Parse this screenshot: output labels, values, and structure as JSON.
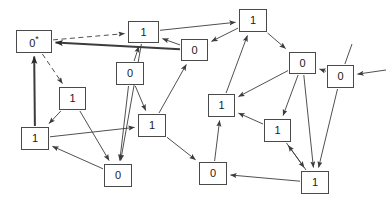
{
  "diagram": {
    "background_color": "#ffffff",
    "node_border_color": "#4a4a4a",
    "edge_color": "#3c3c3c",
    "nodes": [
      {
        "id": "n0",
        "label": "0",
        "marked": true,
        "marker": "*",
        "x": 16,
        "y": 30,
        "w": 36,
        "h": 23
      },
      {
        "id": "n1",
        "label": "1",
        "marked": false,
        "marker": "",
        "x": 128,
        "y": 21,
        "w": 31,
        "h": 22
      },
      {
        "id": "n2",
        "label": "1",
        "marked": false,
        "marker": "",
        "x": 239,
        "y": 9,
        "w": 28,
        "h": 23
      },
      {
        "id": "n3",
        "label": "0",
        "marked": false,
        "marker": "",
        "x": 181,
        "y": 39,
        "w": 27,
        "h": 22
      },
      {
        "id": "n4",
        "label": "0",
        "marked": false,
        "marker": "",
        "x": 289,
        "y": 52,
        "w": 27,
        "h": 22
      },
      {
        "id": "n5",
        "label": "0",
        "marked": false,
        "marker": "",
        "x": 327,
        "y": 65,
        "w": 27,
        "h": 23
      },
      {
        "id": "n6",
        "label": "0",
        "marked": false,
        "marker": "",
        "x": 116,
        "y": 62,
        "w": 28,
        "h": 23
      },
      {
        "id": "n7",
        "label": "1",
        "marked": false,
        "marker": "",
        "x": 59,
        "y": 87,
        "w": 27,
        "h": 23
      },
      {
        "id": "n8",
        "label": "1",
        "marked": false,
        "marker": "",
        "x": 208,
        "y": 94,
        "w": 27,
        "h": 23
      },
      {
        "id": "n9",
        "label": "1",
        "marked": false,
        "marker": "",
        "x": 138,
        "y": 114,
        "w": 28,
        "h": 23
      },
      {
        "id": "n10",
        "label": "1",
        "marked": false,
        "marker": "",
        "x": 264,
        "y": 119,
        "w": 27,
        "h": 23
      },
      {
        "id": "n11",
        "label": "1",
        "marked": false,
        "marker": "",
        "x": 21,
        "y": 127,
        "w": 28,
        "h": 23
      },
      {
        "id": "n12",
        "label": "0",
        "marked": false,
        "marker": "",
        "x": 104,
        "y": 164,
        "w": 28,
        "h": 23
      },
      {
        "id": "n13",
        "label": "0",
        "marked": false,
        "marker": "",
        "x": 199,
        "y": 162,
        "w": 28,
        "h": 23
      },
      {
        "id": "n14",
        "label": "1",
        "marked": false,
        "marker": "",
        "x": 301,
        "y": 171,
        "w": 28,
        "h": 23
      }
    ],
    "edges": [
      {
        "from": "n0",
        "to": "n1",
        "style": "dashed",
        "weight": "normal"
      },
      {
        "from": "n0",
        "to": "n7",
        "style": "dashed",
        "weight": "normal"
      },
      {
        "from": "n3",
        "to": "n0",
        "style": "solid",
        "weight": "thick"
      },
      {
        "from": "n11",
        "to": "n0",
        "style": "solid",
        "weight": "thick"
      },
      {
        "from": "n1",
        "to": "n2",
        "style": "solid",
        "weight": "normal"
      },
      {
        "from": "n1",
        "to": "n12",
        "style": "solid",
        "weight": "normal"
      },
      {
        "from": "n3",
        "to": "n1",
        "style": "solid",
        "weight": "normal"
      },
      {
        "from": "n6",
        "to": "n1",
        "style": "solid",
        "weight": "normal"
      },
      {
        "from": "n2",
        "to": "n4",
        "style": "solid",
        "weight": "normal"
      },
      {
        "from": "n2",
        "to": "n3",
        "style": "solid",
        "weight": "normal"
      },
      {
        "from": "n8",
        "to": "n2",
        "style": "solid",
        "weight": "normal"
      },
      {
        "from": "n9",
        "to": "n3",
        "style": "solid",
        "weight": "normal"
      },
      {
        "from": "n6",
        "to": "n9",
        "style": "solid",
        "weight": "normal"
      },
      {
        "from": "n6",
        "to": "n12",
        "style": "solid",
        "weight": "normal"
      },
      {
        "from": "n7",
        "to": "n11",
        "style": "solid",
        "weight": "normal"
      },
      {
        "from": "n7",
        "to": "n12",
        "style": "solid",
        "weight": "normal"
      },
      {
        "from": "n11",
        "to": "n9",
        "style": "solid",
        "weight": "normal"
      },
      {
        "from": "n12",
        "to": "n11",
        "style": "solid",
        "weight": "normal"
      },
      {
        "from": "n9",
        "to": "n13",
        "style": "solid",
        "weight": "normal"
      },
      {
        "from": "n13",
        "to": "n8",
        "style": "solid",
        "weight": "normal"
      },
      {
        "from": "n10",
        "to": "n8",
        "style": "solid",
        "weight": "normal"
      },
      {
        "from": "n4",
        "to": "n8",
        "style": "solid",
        "weight": "normal"
      },
      {
        "from": "n4",
        "to": "n10",
        "style": "solid",
        "weight": "normal"
      },
      {
        "from": "n4",
        "to": "n14",
        "style": "solid",
        "weight": "normal"
      },
      {
        "from": "n5",
        "to": "n4",
        "style": "solid",
        "weight": "normal"
      },
      {
        "from": "n5",
        "to": "n14",
        "style": "solid",
        "weight": "normal"
      },
      {
        "from": "n5",
        "to": "n_top_right",
        "style": "solid",
        "weight": "normal"
      },
      {
        "from": "n_right_edge",
        "to": "n5",
        "style": "solid",
        "weight": "normal"
      },
      {
        "from": "n10",
        "to": "n14",
        "style": "solid",
        "weight": "normal"
      },
      {
        "from": "n14",
        "to": "n13",
        "style": "solid",
        "weight": "normal"
      },
      {
        "from": "n14",
        "to": "n10",
        "style": "solid",
        "weight": "normal"
      }
    ]
  }
}
